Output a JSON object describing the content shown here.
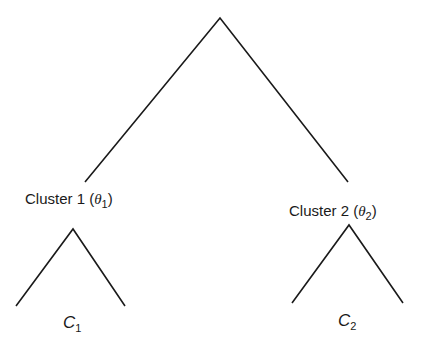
{
  "diagram": {
    "type": "tree",
    "root": {
      "label": ""
    },
    "clusters": [
      {
        "name": "Cluster 1",
        "param_symbol": "θ",
        "param_index": "1",
        "leaf_symbol": "C",
        "leaf_index": "1"
      },
      {
        "name": "Cluster 2",
        "param_symbol": "θ",
        "param_index": "2",
        "leaf_symbol": "C",
        "leaf_index": "2"
      }
    ],
    "line_color": "#1a1a1a"
  }
}
